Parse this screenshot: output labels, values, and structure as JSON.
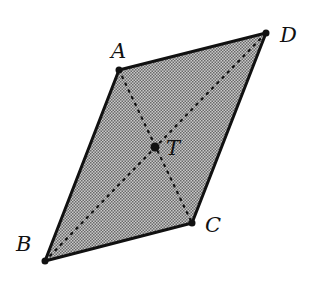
{
  "diagram": {
    "type": "parallelogram",
    "colors": {
      "fill": "#9a9a9a",
      "stroke": "#111111",
      "background": "#ffffff"
    },
    "vertices": [
      {
        "label": "A",
        "x": 119,
        "y": 70
      },
      {
        "label": "D",
        "x": 266,
        "y": 33
      },
      {
        "label": "C",
        "x": 192,
        "y": 223
      },
      {
        "label": "B",
        "x": 45,
        "y": 261
      }
    ],
    "center": {
      "label": "T",
      "x": 155,
      "y": 147
    },
    "diagonals": [
      "AC",
      "BD"
    ],
    "labels": {
      "A": "A",
      "B": "B",
      "C": "C",
      "D": "D",
      "T": "T"
    }
  }
}
